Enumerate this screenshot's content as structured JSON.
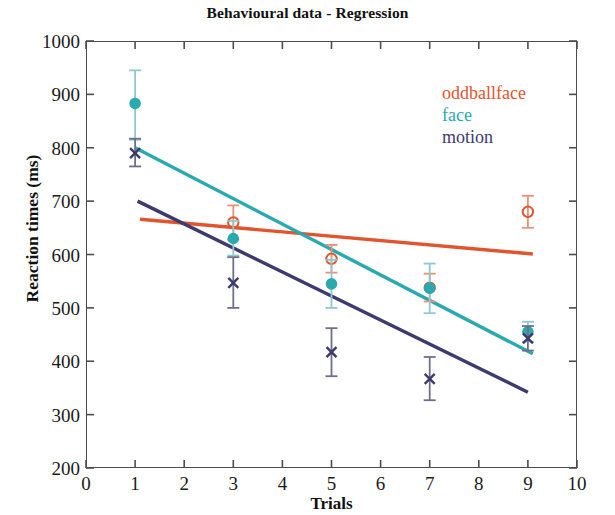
{
  "chart_data": {
    "type": "scatter",
    "title": "Behavioural data - Regression",
    "xlabel": "Trials",
    "ylabel": "Reaction times (ms)",
    "xlim": [
      0,
      10
    ],
    "ylim": [
      200,
      1000
    ],
    "xticks": [
      0,
      1,
      2,
      3,
      4,
      5,
      6,
      7,
      8,
      9,
      10
    ],
    "yticks": [
      200,
      300,
      400,
      500,
      600,
      700,
      800,
      900,
      1000
    ],
    "grid": false,
    "legend_position": "top-right",
    "series": [
      {
        "name": "oddballface",
        "color": "#e0542e",
        "marker": "open-circle",
        "x": [
          3,
          5,
          7,
          9
        ],
        "values": [
          660,
          592,
          538,
          680
        ],
        "yerr_low": [
          628,
          566,
          512,
          650
        ],
        "yerr_high": [
          692,
          618,
          564,
          710
        ],
        "regression_line": {
          "x": [
            1.1,
            9.1
          ],
          "y": [
            666,
            601
          ]
        }
      },
      {
        "name": "face",
        "color": "#2aa9ae",
        "marker": "filled-circle",
        "x": [
          1,
          3,
          5,
          7,
          9
        ],
        "values": [
          883,
          630,
          545,
          537,
          455
        ],
        "yerr_low": [
          815,
          598,
          500,
          490,
          437
        ],
        "yerr_high": [
          945,
          663,
          590,
          583,
          474
        ],
        "regression_line": {
          "x": [
            1.0,
            9.1
          ],
          "y": [
            800,
            414
          ]
        }
      },
      {
        "name": "motion",
        "color": "#3d3a6e",
        "marker": "cross-x",
        "x": [
          1,
          3,
          5,
          7,
          9
        ],
        "values": [
          790,
          547,
          417,
          367,
          443
        ],
        "yerr_low": [
          765,
          500,
          372,
          327,
          420
        ],
        "yerr_high": [
          817,
          595,
          462,
          408,
          466
        ],
        "regression_line": {
          "x": [
            1.05,
            9.0
          ],
          "y": [
            700,
            342
          ]
        }
      }
    ]
  },
  "legend": {
    "entries": [
      {
        "label": "oddballface",
        "color": "#e0542e"
      },
      {
        "label": "face",
        "color": "#2aa9ae"
      },
      {
        "label": "motion",
        "color": "#3d3a6e"
      }
    ]
  },
  "axes": {
    "y_tick_labels": [
      "1000",
      "900",
      "800",
      "700",
      "600",
      "500",
      "400",
      "300",
      "200"
    ],
    "x_tick_labels": [
      "0",
      "1",
      "2",
      "3",
      "4",
      "5",
      "6",
      "7",
      "8",
      "9",
      "10"
    ]
  }
}
